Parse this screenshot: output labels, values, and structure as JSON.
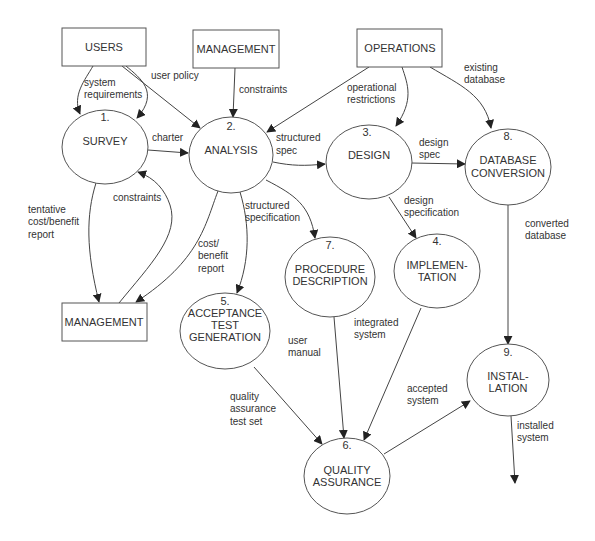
{
  "diagram": {
    "type": "data-flow-diagram",
    "entities": [
      {
        "id": "users",
        "label": "USERS"
      },
      {
        "id": "management_top",
        "label": "MANAGEMENT"
      },
      {
        "id": "operations",
        "label": "OPERATIONS"
      },
      {
        "id": "management_bottom",
        "label": "MANAGEMENT"
      }
    ],
    "processes": [
      {
        "id": "p1",
        "number": "1.",
        "lines": [
          "SURVEY"
        ]
      },
      {
        "id": "p2",
        "number": "2.",
        "lines": [
          "ANALYSIS"
        ]
      },
      {
        "id": "p3",
        "number": "3.",
        "lines": [
          "DESIGN"
        ]
      },
      {
        "id": "p4",
        "number": "4.",
        "lines": [
          "IMPLEMEN-",
          "TATION"
        ]
      },
      {
        "id": "p5",
        "number": "5.",
        "lines": [
          "ACCEPTANCE",
          "TEST",
          "GENERATION"
        ]
      },
      {
        "id": "p6",
        "number": "6.",
        "lines": [
          "QUALITY",
          "ASSURANCE"
        ]
      },
      {
        "id": "p7",
        "number": "7.",
        "lines": [
          "PROCEDURE",
          "DESCRIPTION"
        ]
      },
      {
        "id": "p8",
        "number": "8.",
        "lines": [
          "DATABASE",
          "CONVERSION"
        ]
      },
      {
        "id": "p9",
        "number": "9.",
        "lines": [
          "INSTAL-",
          "LATION"
        ]
      }
    ],
    "flows": [
      {
        "from": "users",
        "to": "p1",
        "lines": [
          "system",
          "requirements"
        ]
      },
      {
        "from": "users",
        "to": "p2",
        "lines": [
          "user policy"
        ]
      },
      {
        "from": "management_top",
        "to": "p2",
        "lines": [
          "constraints"
        ]
      },
      {
        "from": "operations",
        "to": "p2",
        "lines": [
          "operational",
          "restrictions"
        ]
      },
      {
        "from": "operations",
        "to": "p3",
        "lines": []
      },
      {
        "from": "operations",
        "to": "p8",
        "lines": [
          "existing",
          "database"
        ]
      },
      {
        "from": "p1",
        "to": "p2",
        "lines": [
          "charter"
        ]
      },
      {
        "from": "p2",
        "to": "p3",
        "lines": [
          "structured",
          "spec"
        ]
      },
      {
        "from": "p1",
        "to": "management_bottom",
        "lines": [
          "tentative",
          "cost/benefit",
          "report"
        ]
      },
      {
        "from": "management_bottom",
        "to": "p1",
        "lines": [
          "constraints"
        ]
      },
      {
        "from": "p2",
        "to": "management_bottom",
        "lines": [
          "cost/",
          "benefit",
          "report"
        ]
      },
      {
        "from": "p2",
        "to": "p5",
        "lines": [
          "structured",
          "specification"
        ]
      },
      {
        "from": "p2",
        "to": "p7",
        "lines": []
      },
      {
        "from": "p3",
        "to": "p8",
        "lines": [
          "design",
          "spec"
        ]
      },
      {
        "from": "p3",
        "to": "p4",
        "lines": [
          "design",
          "specification"
        ]
      },
      {
        "from": "p8",
        "to": "p9",
        "lines": [
          "converted",
          "database"
        ]
      },
      {
        "from": "p7",
        "to": "p6",
        "lines": [
          "user",
          "manual"
        ]
      },
      {
        "from": "p4",
        "to": "p6",
        "lines": [
          "integrated",
          "system"
        ]
      },
      {
        "from": "p5",
        "to": "p6",
        "lines": [
          "quality",
          "assurance",
          "test set"
        ]
      },
      {
        "from": "p6",
        "to": "p9",
        "lines": [
          "accepted",
          "system"
        ]
      },
      {
        "from": "p9",
        "to": "out",
        "lines": [
          "installed",
          "system"
        ]
      }
    ]
  },
  "colors": {
    "stroke": "#555555",
    "text": "#333333",
    "background": "#ffffff"
  }
}
